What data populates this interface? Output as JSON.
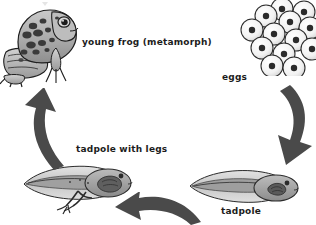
{
  "diagram": {
    "type": "cycle",
    "direction": "counterclockwise",
    "background_color": "#ffffff",
    "arrow_color": "#4a4a4a",
    "text_color": "#1c1c1c",
    "illustration_fill": "#b4b4b4",
    "illustration_outline": "#1e1e1e"
  },
  "stages": [
    {
      "id": "eggs",
      "label": "eggs",
      "position": "top-right",
      "icon": "egg-cluster-icon",
      "egg_count": 13,
      "description": "cluster of round eggs each with a dark central nucleus"
    },
    {
      "id": "tadpole",
      "label": "tadpole",
      "position": "bottom-right",
      "icon": "tadpole-icon",
      "description": "tadpole with rounded body on the right and long tail to the left"
    },
    {
      "id": "tadpole-with-legs",
      "label": "tadpole with legs",
      "position": "bottom-left",
      "icon": "tadpole-with-legs-icon",
      "description": "tadpole with developing hind legs"
    },
    {
      "id": "young-frog",
      "label": "young frog (metamorph)",
      "position": "top-left",
      "icon": "frog-icon",
      "description": "spotted young frog sitting facing right"
    }
  ],
  "arrows": [
    {
      "id": "arrow-eggs-to-tadpole",
      "from": "eggs",
      "to": "tadpole",
      "side": "right",
      "points": "down"
    },
    {
      "id": "arrow-tadpole-to-tadpole-with-legs",
      "from": "tadpole",
      "to": "tadpole-with-legs",
      "side": "bottom",
      "points": "left"
    },
    {
      "id": "arrow-tadpole-with-legs-to-frog",
      "from": "tadpole-with-legs",
      "to": "young-frog",
      "side": "left",
      "points": "up"
    }
  ]
}
